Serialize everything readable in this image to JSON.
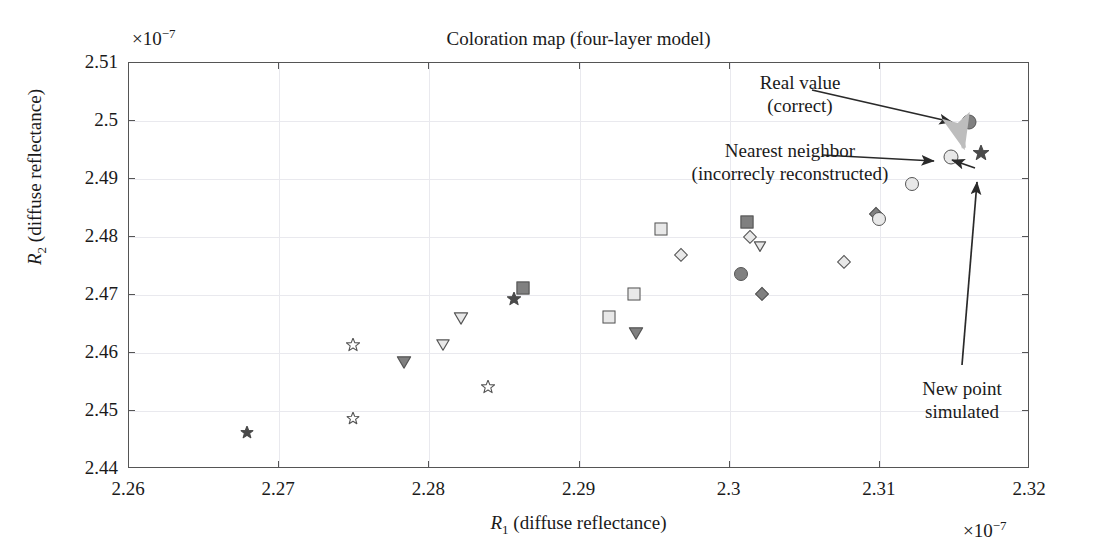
{
  "chart_data": {
    "type": "scatter",
    "title": "Coloration map (four-layer model)",
    "xlabel": "R₁ (diffuse reflectance)",
    "ylabel": "R₂ (diffuse reflectance)",
    "x_exponent": "×10⁻⁷",
    "y_exponent": "×10⁻⁷",
    "xlim": [
      2.26,
      2.32
    ],
    "ylim": [
      2.44,
      2.51
    ],
    "xticks": [
      "2.26",
      "2.27",
      "2.28",
      "2.29",
      "2.3",
      "2.31",
      "2.32"
    ],
    "yticks": [
      "2.44",
      "2.45",
      "2.46",
      "2.47",
      "2.48",
      "2.49",
      "2.5",
      "2.51"
    ],
    "grid": true,
    "legend": "none",
    "colors": {
      "filled_gray": "#808080",
      "open_gray": "#e8e8e8",
      "edge": "#555555",
      "dark_marker": "#4a4a4a",
      "highlight_light": "#d9d9d9",
      "axis": "#555555",
      "grid": "#e9e9ee",
      "text": "#1a1a1a"
    },
    "points": [
      {
        "x": 2.2679,
        "y": 2.4459,
        "marker": "star",
        "fill": "filled",
        "size": 13
      },
      {
        "x": 2.275,
        "y": 2.4608,
        "marker": "star",
        "fill": "open",
        "size": 14
      },
      {
        "x": 2.275,
        "y": 2.4483,
        "marker": "star",
        "fill": "open",
        "size": 13
      },
      {
        "x": 2.2784,
        "y": 2.458,
        "marker": "triangle-down",
        "fill": "filled",
        "size": 15
      },
      {
        "x": 2.281,
        "y": 2.461,
        "marker": "triangle-down",
        "fill": "open",
        "size": 14
      },
      {
        "x": 2.2822,
        "y": 2.4655,
        "marker": "triangle-down",
        "fill": "open",
        "size": 15
      },
      {
        "x": 2.284,
        "y": 2.4537,
        "marker": "star",
        "fill": "open",
        "size": 14
      },
      {
        "x": 2.2857,
        "y": 2.4688,
        "marker": "star",
        "fill": "filled",
        "size": 14
      },
      {
        "x": 2.2863,
        "y": 2.471,
        "marker": "square",
        "fill": "filled",
        "size": 13
      },
      {
        "x": 2.292,
        "y": 2.466,
        "marker": "square",
        "fill": "open",
        "size": 13
      },
      {
        "x": 2.2937,
        "y": 2.47,
        "marker": "square",
        "fill": "open",
        "size": 13
      },
      {
        "x": 2.2938,
        "y": 2.463,
        "marker": "triangle-down",
        "fill": "filled",
        "size": 15
      },
      {
        "x": 2.2955,
        "y": 2.4812,
        "marker": "square",
        "fill": "open",
        "size": 13
      },
      {
        "x": 2.2968,
        "y": 2.4767,
        "marker": "diamond",
        "fill": "open",
        "size": 13
      },
      {
        "x": 2.3008,
        "y": 2.4735,
        "marker": "circle",
        "fill": "filled",
        "size": 14
      },
      {
        "x": 2.3012,
        "y": 2.4825,
        "marker": "square",
        "fill": "filled",
        "size": 13
      },
      {
        "x": 2.3014,
        "y": 2.4798,
        "marker": "diamond",
        "fill": "open",
        "size": 13
      },
      {
        "x": 2.3021,
        "y": 2.478,
        "marker": "triangle-down",
        "fill": "open",
        "size": 13
      },
      {
        "x": 2.3022,
        "y": 2.47,
        "marker": "diamond",
        "fill": "filled",
        "size": 13
      },
      {
        "x": 2.3077,
        "y": 2.4755,
        "marker": "diamond",
        "fill": "open",
        "size": 13
      },
      {
        "x": 2.3098,
        "y": 2.4838,
        "marker": "diamond",
        "fill": "filled",
        "size": 13
      },
      {
        "x": 2.31,
        "y": 2.483,
        "marker": "circle",
        "fill": "open",
        "size": 14
      },
      {
        "x": 2.3122,
        "y": 2.489,
        "marker": "circle",
        "fill": "open",
        "size": 14
      },
      {
        "x": 2.3148,
        "y": 2.4937,
        "marker": "circle",
        "fill": "open",
        "size": 15
      },
      {
        "x": 2.316,
        "y": 2.4997,
        "marker": "circle",
        "fill": "filled",
        "size": 15
      },
      {
        "x": 2.3168,
        "y": 2.494,
        "marker": "star",
        "fill": "filled",
        "size": 16
      }
    ]
  },
  "annotations": [
    {
      "id": "real-value",
      "line1": "Real value",
      "line2": "(correct)"
    },
    {
      "id": "nearest-neighbor",
      "line1": "Nearest neighbor",
      "line2": "(incorrecly reconstructed)"
    },
    {
      "id": "new-point",
      "line1": "New point",
      "line2": "simulated"
    }
  ]
}
